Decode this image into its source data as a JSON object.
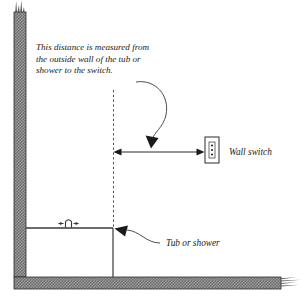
{
  "diagram": {
    "background_color": "#ffffff",
    "ink_color": "#1a1a1a",
    "wall_fill_color": "#8c8c8c",
    "annotation": {
      "name": "distance-note",
      "line1": "This distance is measured from",
      "line2": "the outside wall of the tub or",
      "line3": "shower to the switch."
    },
    "labels": {
      "wall_switch": "Wall switch",
      "tub_or_shower": "Tub or shower"
    },
    "icons": {
      "wall_switch_plate": "switch-plate-icon",
      "tub_faucet": "faucet-icon",
      "dimension_arrow": "double-arrow-icon",
      "leader_arrow": "curved-leader-arrow-icon",
      "wall_break": "break-mark-icon",
      "floor_break": "break-mark-icon"
    },
    "elements": {
      "wall": "vertical-wall",
      "floor": "floor-slab",
      "tub": "tub-outline",
      "reference_line": "dashed-reference-line"
    }
  }
}
